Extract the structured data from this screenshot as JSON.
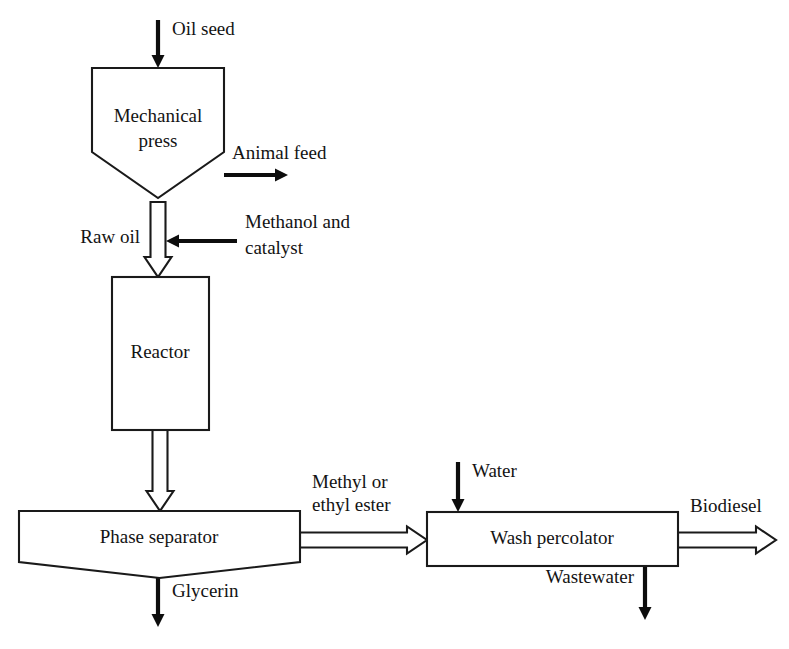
{
  "diagram": {
    "type": "process-flow-diagram",
    "background_color": "#ffffff",
    "line_color": "#1a1a1a",
    "solid_arrow_color": "#0d0d0d",
    "units": [
      {
        "id": "mechanical-press",
        "label_line1": "Mechanical",
        "label_line2": "press",
        "shape": "pentagon-hopper",
        "x": 92,
        "y": 68,
        "width": 132,
        "height": 130,
        "shoulder_y": 152,
        "text_x": 158,
        "text_y1": 118,
        "text_y2": 143
      },
      {
        "id": "reactor",
        "label_line1": "Reactor",
        "label_line2": "",
        "shape": "rectangle",
        "x": 112,
        "y": 277,
        "width": 97,
        "height": 153,
        "text_x": 160,
        "text_y1": 354,
        "text_y2": 0
      },
      {
        "id": "phase-separator",
        "label_line1": "Phase separator",
        "label_line2": "",
        "shape": "pentagon-hopper",
        "x": 19,
        "y": 511,
        "width": 281,
        "height": 67,
        "shoulder_y": 562,
        "text_x": 159,
        "text_y1": 539,
        "text_y2": 0
      },
      {
        "id": "wash-percolator",
        "label_line1": "Wash percolator",
        "label_line2": "",
        "shape": "rectangle",
        "x": 427,
        "y": 512,
        "width": 251,
        "height": 54,
        "text_x": 552,
        "text_y1": 540,
        "text_y2": 0
      }
    ],
    "streams": [
      {
        "id": "oil-seed",
        "label": "Oil seed",
        "arrow_style": "solid",
        "direction": "down",
        "x1": 158,
        "y1": 20,
        "x2": 158,
        "y2": 68,
        "label_x": 172,
        "label_y": 35,
        "label_anchor": "start"
      },
      {
        "id": "animal-feed",
        "label": "Animal feed",
        "arrow_style": "solid",
        "direction": "right",
        "x1": 224,
        "y1": 175,
        "x2": 288,
        "y2": 175,
        "label_x": 232,
        "label_y": 159,
        "label_anchor": "start"
      },
      {
        "id": "raw-oil",
        "label": "Raw oil",
        "arrow_style": "block",
        "direction": "down",
        "x1": 158,
        "y1": 202,
        "x2": 158,
        "y2": 277,
        "shaft_width": 15,
        "head_width": 27,
        "head_length": 20,
        "label_x": 140,
        "label_y": 243,
        "label_anchor": "end"
      },
      {
        "id": "methanol-and-catalyst",
        "label": "Methanol and",
        "label_line2": "catalyst",
        "arrow_style": "solid",
        "direction": "left",
        "x1": 237,
        "y1": 241,
        "x2": 166,
        "y2": 241,
        "label_x": 245,
        "label_y": 228,
        "label_anchor": "start",
        "label2_x": 245,
        "label2_y": 254
      },
      {
        "id": "reactor-to-separator",
        "label": "",
        "arrow_style": "block",
        "direction": "down",
        "x1": 160,
        "y1": 430,
        "x2": 160,
        "y2": 511,
        "shaft_width": 15,
        "head_width": 27,
        "head_length": 20,
        "label_x": 0,
        "label_y": 0,
        "label_anchor": "start"
      },
      {
        "id": "glycerin",
        "label": "Glycerin",
        "arrow_style": "solid",
        "direction": "down",
        "x1": 158,
        "y1": 578,
        "x2": 158,
        "y2": 627,
        "label_x": 172,
        "label_y": 597,
        "label_anchor": "start"
      },
      {
        "id": "methyl-or-ethyl-ester",
        "label": "Methyl or",
        "label_line2": "ethyl ester",
        "arrow_style": "block",
        "direction": "right",
        "x1": 300,
        "y1": 540,
        "x2": 427,
        "y2": 540,
        "shaft_width": 15,
        "head_width": 27,
        "head_length": 20,
        "label_x": 312,
        "label_y": 488,
        "label_anchor": "start",
        "label2_x": 312,
        "label2_y": 511
      },
      {
        "id": "water",
        "label": "Water",
        "arrow_style": "solid",
        "direction": "down",
        "x1": 458,
        "y1": 462,
        "x2": 458,
        "y2": 512,
        "label_x": 472,
        "label_y": 477,
        "label_anchor": "start"
      },
      {
        "id": "wastewater",
        "label": "Wastewater",
        "arrow_style": "solid",
        "direction": "down",
        "x1": 645,
        "y1": 566,
        "x2": 645,
        "y2": 620,
        "label_x": 634,
        "label_y": 583,
        "label_anchor": "end"
      },
      {
        "id": "biodiesel",
        "label": "Biodiesel",
        "arrow_style": "block",
        "direction": "right",
        "x1": 678,
        "y1": 540,
        "x2": 776,
        "y2": 540,
        "shaft_width": 15,
        "head_width": 27,
        "head_length": 20,
        "label_x": 690,
        "label_y": 512,
        "label_anchor": "start"
      }
    ]
  }
}
